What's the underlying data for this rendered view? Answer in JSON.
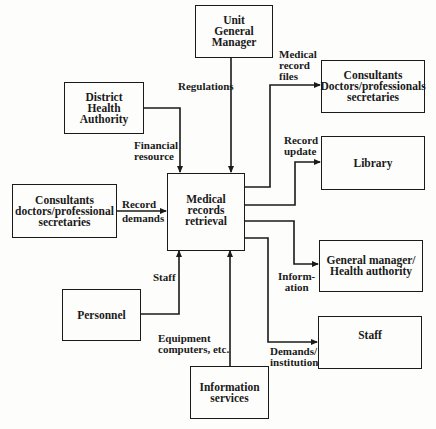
{
  "diagram": {
    "type": "context flow diagram",
    "central_process": "Medical\nrecords\nretrieval",
    "boxes": {
      "unit_general_manager": "Unit\nGeneral\nManager",
      "district_health_authority": "District\nHealth\nAuthority",
      "consultants_left": "Consultants\ndoctors/professional\nsecretaries",
      "personnel": "Personnel",
      "information_services": "Information\nservices",
      "consultants_right": "Consultants\nDoctors/professionals\nsecretaries",
      "library": "Library",
      "general_manager_health_authority": "General manager/\nHealth authority",
      "staff": "Staff"
    },
    "flows": {
      "regulations": "Regulations",
      "financial_resource": "Financial\nresource",
      "record_demands": "Record\ndemands",
      "staff": "Staff",
      "equipment": "Equipment\ncomputers, etc.",
      "medical_record_files": "Medical\nrecord\nfiles",
      "record_update": "Record\nupdate",
      "information": "Inform-\nation",
      "demands_institution": "Demands/\ninstitution"
    },
    "edges": [
      {
        "from": "Unit General Manager",
        "to": "Medical records retrieval",
        "label": "Regulations"
      },
      {
        "from": "District Health Authority",
        "to": "Medical records retrieval",
        "label": "Financial resource"
      },
      {
        "from": "Consultants doctors/professional secretaries",
        "to": "Medical records retrieval",
        "label": "Record demands"
      },
      {
        "from": "Personnel",
        "to": "Medical records retrieval",
        "label": "Staff"
      },
      {
        "from": "Information services",
        "to": "Medical records retrieval",
        "label": "Equipment computers, etc."
      },
      {
        "from": "Medical records retrieval",
        "to": "Consultants Doctors/professionals secretaries",
        "label": "Medical record files"
      },
      {
        "from": "Medical records retrieval",
        "to": "Library",
        "label": "Record update"
      },
      {
        "from": "Medical records retrieval",
        "to": "General manager/Health authority",
        "label": "Information"
      },
      {
        "from": "Medical records retrieval",
        "to": "Staff",
        "label": "Demands/institution"
      }
    ]
  }
}
